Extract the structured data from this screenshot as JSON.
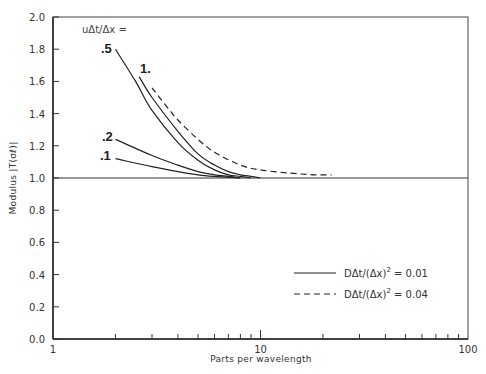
{
  "chart_data": {
    "type": "line",
    "title": "",
    "xlabel": "Parts per wavelength",
    "ylabel": "Modulus |T(σℓ)|",
    "xscale": "log",
    "xlim": [
      1,
      100
    ],
    "ylim": [
      0.0,
      2.0
    ],
    "x_tick_labels": [
      "1",
      "10",
      "100"
    ],
    "y_tick_labels": [
      "0.0",
      "0.2",
      "0.4",
      "0.6",
      "0.8",
      "1.0",
      "1.2",
      "1.4",
      "1.6",
      "1.8",
      "2.0"
    ],
    "grid": false,
    "reference_line": {
      "y": 1.0
    },
    "parameter_label": "uΔt/Δx =",
    "legend": {
      "position": "lower right",
      "entries": [
        {
          "style": "solid",
          "label": "DΔt/(Δx)² = 0.01",
          "text": "DΔt/(Δx)",
          "exp": "2",
          "value": " = 0.01"
        },
        {
          "style": "dashed",
          "label": "DΔt/(Δx)² = 0.04",
          "text": "DΔt/(Δx)",
          "exp": "2",
          "value": " = 0.04"
        }
      ]
    },
    "series": [
      {
        "name": ".1",
        "style": "solid",
        "D": 0.01,
        "x": [
          2.0,
          3.0,
          4.0,
          5.0,
          6.0,
          7.0,
          8.0
        ],
        "y": [
          1.12,
          1.07,
          1.04,
          1.02,
          1.01,
          1.005,
          1.0
        ]
      },
      {
        "name": ".2",
        "style": "solid",
        "D": 0.01,
        "x": [
          2.0,
          3.0,
          4.0,
          5.0,
          6.0,
          7.0,
          8.0
        ],
        "y": [
          1.24,
          1.14,
          1.08,
          1.04,
          1.02,
          1.01,
          1.0
        ]
      },
      {
        "name": ".5",
        "style": "solid",
        "D": 0.01,
        "x": [
          2.0,
          2.5,
          3.0,
          4.0,
          5.0,
          6.0,
          7.0,
          8.0,
          9.0
        ],
        "y": [
          1.8,
          1.6,
          1.42,
          1.22,
          1.11,
          1.05,
          1.02,
          1.01,
          1.0
        ]
      },
      {
        "name": "1.",
        "style": "solid",
        "D": 0.01,
        "x": [
          2.6,
          3.0,
          4.0,
          5.0,
          6.0,
          7.0,
          8.0,
          9.0,
          10.0
        ],
        "y": [
          1.63,
          1.5,
          1.29,
          1.15,
          1.08,
          1.04,
          1.02,
          1.01,
          1.0
        ]
      },
      {
        "name": "1.",
        "style": "dashed",
        "D": 0.04,
        "x": [
          3.0,
          3.5,
          4.0,
          5.0,
          6.0,
          8.0,
          10.0,
          14.0,
          18.0,
          22.0
        ],
        "y": [
          1.56,
          1.45,
          1.36,
          1.24,
          1.16,
          1.08,
          1.05,
          1.03,
          1.02,
          1.02
        ]
      }
    ],
    "curve_labels": [
      ".5",
      "1.",
      ".2",
      ".1"
    ]
  }
}
